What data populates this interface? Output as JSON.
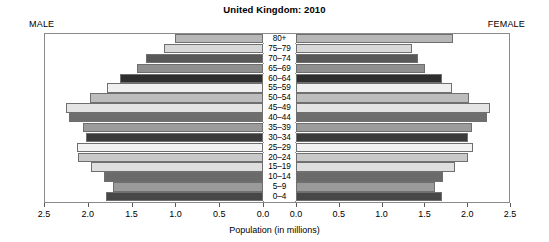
{
  "chart_data": {
    "type": "bar",
    "subtype": "population-pyramid",
    "title": "United Kingdom: 2010",
    "xlabel": "Population (in millions)",
    "ylabel": "",
    "grid": false,
    "legend_position": "none",
    "left_side_label": "MALE",
    "right_side_label": "FEMALE",
    "axis_ticks_left": [
      "2.5",
      "2.0",
      "1.5",
      "1.0",
      "0.5",
      "0.0"
    ],
    "axis_ticks_right": [
      "0.0",
      "0.5",
      "1.0",
      "1.5",
      "2.0",
      "2.5"
    ],
    "xlim_each_side": [
      0.0,
      2.5
    ],
    "categories": [
      "80+",
      "75–79",
      "70–74",
      "65–69",
      "60–64",
      "55–59",
      "50–54",
      "45–49",
      "40–44",
      "35–39",
      "30–34",
      "25–29",
      "20–24",
      "15–19",
      "10–14",
      "5–9",
      "0–4"
    ],
    "series": [
      {
        "name": "MALE",
        "side": "left",
        "values": [
          1.0,
          1.13,
          1.33,
          1.44,
          1.63,
          1.78,
          1.98,
          2.25,
          2.22,
          2.05,
          2.02,
          2.12,
          2.11,
          1.96,
          1.81,
          1.71,
          1.79
        ]
      },
      {
        "name": "FEMALE",
        "side": "right",
        "values": [
          1.83,
          1.35,
          1.43,
          1.51,
          1.71,
          1.82,
          2.02,
          2.27,
          2.23,
          2.06,
          2.01,
          2.07,
          2.01,
          1.86,
          1.72,
          1.62,
          1.7
        ]
      }
    ],
    "bar_colors": [
      "#b7b7b7",
      "#d8d8d8",
      "#585858",
      "#8f8f8f",
      "#2e2e2e",
      "#efefef",
      "#bdbdbd",
      "#e4e4e4",
      "#6e6e6e",
      "#9b9b9b",
      "#3b3b3b",
      "#f2f2f2",
      "#c9c9c9",
      "#dedede",
      "#6a6a6a",
      "#9a9a9a",
      "#474747"
    ],
    "bar_edge_color": "#6f6f6f",
    "frame_color": "#8a8a8a",
    "background": "#ffffff"
  }
}
